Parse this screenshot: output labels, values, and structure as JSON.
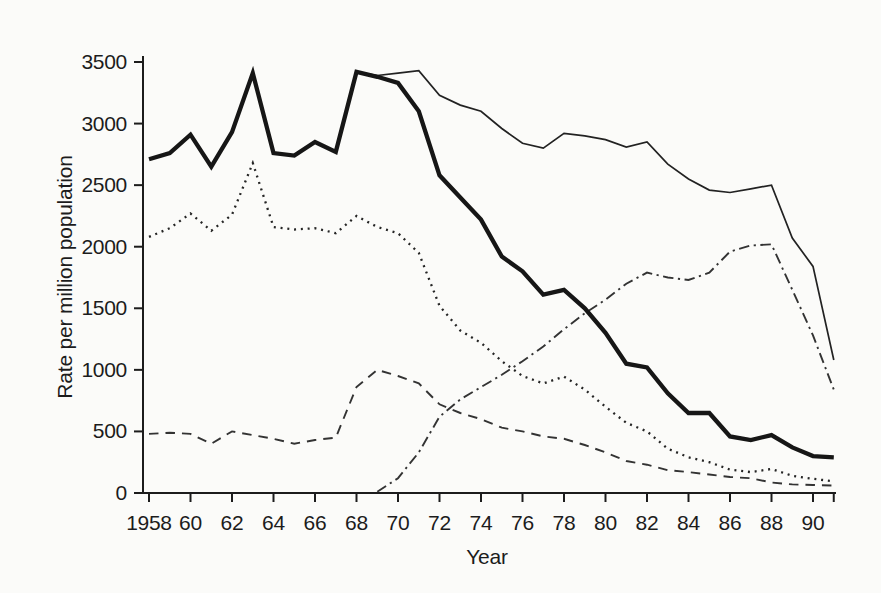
{
  "figure": {
    "background": "#fbfbf9",
    "ink_color": "#1c1c1c"
  },
  "chart_data": {
    "type": "line",
    "title": "",
    "xlabel": "Year",
    "ylabel": "Rate per million population",
    "grid": false,
    "legend": "none",
    "xlim": [
      1958,
      1991
    ],
    "ylim": [
      0,
      3500
    ],
    "yticks": [
      0,
      500,
      1000,
      1500,
      2000,
      2500,
      3000,
      3500
    ],
    "ytick_labels": [
      "0",
      "500",
      "1000",
      "1500",
      "2000",
      "2500",
      "3000",
      "3500"
    ],
    "xtick_years": [
      1958,
      1960,
      1962,
      1964,
      1966,
      1968,
      1970,
      1972,
      1974,
      1976,
      1978,
      1980,
      1982,
      1984,
      1986,
      1988,
      1990
    ],
    "xtick_labels": [
      "1958",
      "60",
      "62",
      "64",
      "66",
      "68",
      "70",
      "72",
      "74",
      "76",
      "78",
      "80",
      "82",
      "84",
      "86",
      "88",
      "90"
    ],
    "xtick_unlabeled_years": [
      1991
    ],
    "x": [
      1958,
      1959,
      1960,
      1961,
      1962,
      1963,
      1964,
      1965,
      1966,
      1967,
      1968,
      1969,
      1970,
      1971,
      1972,
      1973,
      1974,
      1975,
      1976,
      1977,
      1978,
      1979,
      1980,
      1981,
      1982,
      1983,
      1984,
      1985,
      1986,
      1987,
      1988,
      1989,
      1990,
      1991
    ],
    "series": [
      {
        "name": "dashed-line",
        "line_style": "dashed",
        "weight": "normal",
        "values": [
          480,
          490,
          480,
          400,
          500,
          470,
          440,
          400,
          430,
          450,
          860,
          1000,
          950,
          890,
          720,
          650,
          600,
          530,
          500,
          460,
          440,
          390,
          330,
          260,
          230,
          185,
          170,
          150,
          130,
          120,
          85,
          70,
          65,
          60
        ]
      },
      {
        "name": "dash-dot-line",
        "line_style": "dash-dot",
        "weight": "normal",
        "values": [
          null,
          null,
          null,
          null,
          null,
          null,
          null,
          null,
          null,
          null,
          null,
          10,
          120,
          330,
          620,
          760,
          860,
          960,
          1070,
          1190,
          1330,
          1460,
          1570,
          1700,
          1790,
          1750,
          1730,
          1790,
          1960,
          2010,
          2020,
          1650,
          1280,
          840
        ]
      },
      {
        "name": "dotted-line",
        "line_style": "dotted",
        "weight": "normal",
        "values": [
          2080,
          2150,
          2270,
          2130,
          2260,
          2680,
          2160,
          2140,
          2150,
          2110,
          2250,
          2160,
          2110,
          1950,
          1520,
          1320,
          1220,
          1070,
          950,
          890,
          945,
          840,
          700,
          570,
          500,
          360,
          290,
          250,
          190,
          170,
          195,
          140,
          115,
          95
        ]
      },
      {
        "name": "thin-solid-line",
        "line_style": "solid",
        "weight": "thin",
        "values": [
          null,
          null,
          null,
          null,
          null,
          null,
          null,
          null,
          null,
          null,
          3420,
          3390,
          3410,
          3430,
          3230,
          3150,
          3100,
          2960,
          2840,
          2800,
          2920,
          2900,
          2870,
          2810,
          2850,
          2670,
          2550,
          2460,
          2440,
          2470,
          2500,
          2070,
          1840,
          1080
        ]
      },
      {
        "name": "thick-solid-line",
        "line_style": "solid",
        "weight": "thick",
        "values": [
          2710,
          2760,
          2910,
          2650,
          2930,
          3410,
          2760,
          2740,
          2850,
          2770,
          3420,
          3380,
          3330,
          3100,
          2580,
          2400,
          2220,
          1920,
          1800,
          1610,
          1650,
          1500,
          1300,
          1050,
          1020,
          810,
          650,
          650,
          460,
          430,
          470,
          370,
          300,
          290
        ]
      }
    ]
  }
}
